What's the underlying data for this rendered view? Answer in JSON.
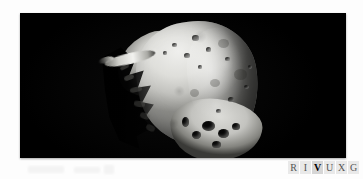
{
  "figure": {
    "kind": "astronomical-photograph",
    "background_color": "#000000",
    "page_color": "#fdfdfd"
  },
  "spectrum_band": {
    "name": "RIVUXG wavelength indicator",
    "cells": [
      {
        "letter": "R",
        "band": "radio",
        "state": "dim"
      },
      {
        "letter": "I",
        "band": "infrared",
        "state": "dim"
      },
      {
        "letter": "V",
        "band": "visible",
        "state": "active"
      },
      {
        "letter": "U",
        "band": "ultraviolet",
        "state": "dim"
      },
      {
        "letter": "X",
        "band": "x-ray",
        "state": "dim"
      },
      {
        "letter": "G",
        "band": "gamma-ray",
        "state": "dim"
      }
    ]
  },
  "asteroid": {
    "name": "asteroid-body",
    "illumination": "lit from upper right",
    "terminator": "jagged shadow boundary on the left flank",
    "surface_features": [
      "large shallow crater upper body",
      "deep shadowed craters along lower rim",
      "bright ridge spike projecting to upper left",
      "cratered regolith mottling"
    ]
  }
}
